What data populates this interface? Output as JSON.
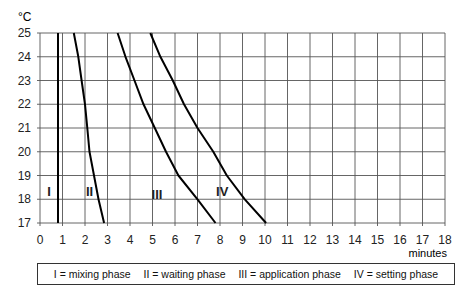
{
  "chart_data": {
    "type": "line",
    "title": "",
    "ylabel": "°C",
    "xlabel": "minutes",
    "xlim": [
      0,
      18
    ],
    "ylim": [
      17,
      25
    ],
    "x_ticks": [
      0,
      1,
      2,
      3,
      4,
      5,
      6,
      7,
      8,
      9,
      10,
      11,
      12,
      13,
      14,
      15,
      16,
      17,
      18
    ],
    "y_ticks": [
      17,
      18,
      19,
      20,
      21,
      22,
      23,
      24,
      25
    ],
    "grid": true,
    "series": [
      {
        "name": "I",
        "label": "mixing phase",
        "label_pos": [
          0.4,
          18.3
        ],
        "points": [
          [
            0.8,
            25
          ],
          [
            0.8,
            17
          ]
        ]
      },
      {
        "name": "II",
        "label": "waiting phase",
        "label_pos": [
          2.2,
          18.3
        ],
        "points": [
          [
            1.5,
            25
          ],
          [
            1.7,
            24
          ],
          [
            1.85,
            23
          ],
          [
            2.0,
            22
          ],
          [
            2.1,
            21
          ],
          [
            2.2,
            20
          ],
          [
            2.4,
            19
          ],
          [
            2.6,
            18
          ],
          [
            2.85,
            17
          ]
        ]
      },
      {
        "name": "III",
        "label": "application phase",
        "label_pos": [
          5.2,
          18.2
        ],
        "points": [
          [
            3.45,
            25
          ],
          [
            3.8,
            24
          ],
          [
            4.2,
            23
          ],
          [
            4.6,
            22
          ],
          [
            5.1,
            21
          ],
          [
            5.6,
            20
          ],
          [
            6.15,
            19
          ],
          [
            7.0,
            18
          ],
          [
            7.8,
            17
          ]
        ]
      },
      {
        "name": "IV",
        "label": "setting phase",
        "label_pos": [
          8.1,
          18.3
        ],
        "points": [
          [
            4.9,
            25
          ],
          [
            5.35,
            24
          ],
          [
            5.9,
            23
          ],
          [
            6.4,
            22
          ],
          [
            7.0,
            21
          ],
          [
            7.7,
            20
          ],
          [
            8.3,
            19
          ],
          [
            9.1,
            18
          ],
          [
            10.05,
            17
          ]
        ]
      }
    ],
    "legend": [
      "I = mixing phase",
      "II = waiting phase",
      "III = application phase",
      "IV = setting phase"
    ],
    "legend_position": "bottom"
  },
  "axis": {
    "y_unit": "°C",
    "x_unit": "minutes"
  },
  "legend": {
    "items": [
      "I = mixing phase",
      "II = waiting phase",
      "III = application phase",
      "IV = setting phase"
    ]
  }
}
